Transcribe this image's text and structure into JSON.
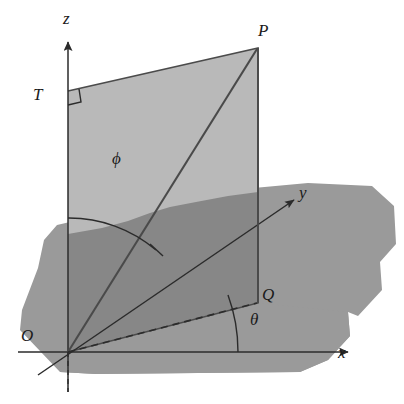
{
  "figure": {
    "background_color": "#ffffff",
    "stroke_color": "#1a1a1a"
  },
  "colors": {
    "ground_plane": "#9a9a9a",
    "vertical_plane_upper": "#b9b9b9",
    "vertical_plane_lower": "#878787",
    "line": "#2b2b2b",
    "label": "#1a1a1a"
  },
  "axes": [
    {
      "name": "x-axis",
      "label": "x",
      "label_x": 338,
      "label_y": 344,
      "tip_x": 350,
      "tip_y": 352
    },
    {
      "name": "y-axis",
      "label": "y",
      "label_x": 299,
      "label_y": 184,
      "tip_x": 295,
      "tip_y": 199
    },
    {
      "name": "z-axis",
      "label": "z",
      "label_x": 63,
      "label_y": 10,
      "tip_x": 68,
      "tip_y": 40
    }
  ],
  "points": [
    {
      "name": "origin",
      "label": "O",
      "label_x": 21,
      "label_y": 327,
      "x": 68,
      "y": 352
    },
    {
      "name": "point-p",
      "label": "P",
      "label_x": 258,
      "label_y": 22,
      "x": 258,
      "y": 48
    },
    {
      "name": "point-q",
      "label": "Q",
      "label_x": 262,
      "label_y": 286,
      "x": 258,
      "y": 303
    },
    {
      "name": "point-t",
      "label": "T",
      "label_x": 33,
      "label_y": 86,
      "x": 68,
      "y": 91
    }
  ],
  "angles": [
    {
      "name": "angle-phi",
      "label": "ϕ",
      "label_x": 112,
      "label_y": 150,
      "vertex": "origin",
      "between": "z-axis and OP"
    },
    {
      "name": "angle-theta",
      "label": "θ",
      "label_x": 250,
      "label_y": 311,
      "vertex": "origin",
      "between": "x-axis and OQ"
    }
  ],
  "markers": [
    {
      "name": "right-angle-at-t",
      "x": 68,
      "y": 91,
      "size": 13
    }
  ],
  "segments": [
    {
      "name": "segment-op",
      "from": "origin",
      "to": "point-p",
      "style": "solid"
    },
    {
      "name": "segment-oq",
      "from": "origin",
      "to": "point-q",
      "style": "dashed"
    },
    {
      "name": "segment-pq",
      "from": "point-p",
      "to": "point-q",
      "style": "solid"
    },
    {
      "name": "segment-tp",
      "from": "point-t",
      "to": "point-p",
      "style": "solid"
    },
    {
      "name": "segment-ot",
      "from": "origin",
      "to": "point-t",
      "style": "solid"
    }
  ]
}
